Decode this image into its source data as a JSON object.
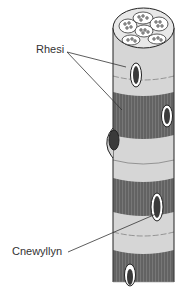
{
  "diagram": {
    "labels": {
      "rhesi": "Rhesi",
      "cnewyllyn": "Cnewyllyn"
    },
    "colors": {
      "light_band": "#d4d4d4",
      "dark_band": "#6e6e6e",
      "outline": "#222222",
      "nucleus": "#3a3a3a"
    }
  }
}
